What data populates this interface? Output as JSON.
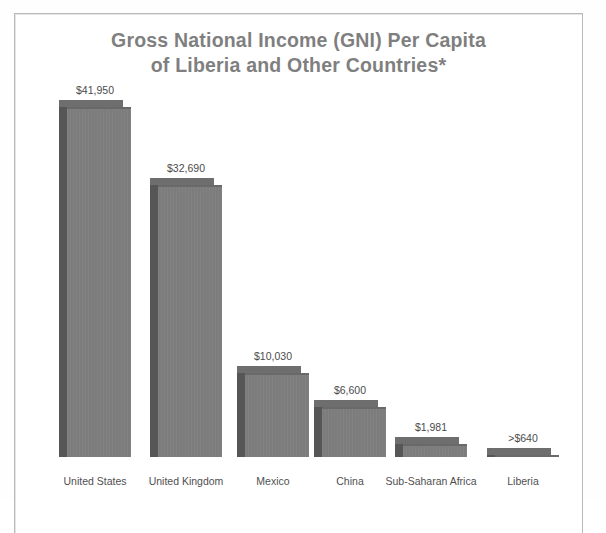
{
  "figure": {
    "title_line_1": "Gross National Income (GNI) Per Capita",
    "title_line_2": "of Liberia and Other Countries*",
    "title_color": "#7f7f7f",
    "background_color": "#ffffff",
    "frame_color": "#b9b9b9"
  },
  "chart_data": {
    "type": "bar",
    "title": "Gross National Income (GNI) Per Capita of Liberia and Other Countries*",
    "xlabel": "",
    "ylabel": "",
    "grid": false,
    "legend": false,
    "ylim": [
      0,
      41950
    ],
    "style": "3d-column",
    "bar_color": "#7c7c7c",
    "bar_side_color": "#565656",
    "bar_top_color": "#6e6e6e",
    "categories": [
      "United States",
      "United Kingdom",
      "Mexico",
      "China",
      "Sub-Saharan Africa",
      "Liberia"
    ],
    "values": [
      41950,
      32690,
      10030,
      6600,
      1981,
      640
    ],
    "value_labels": [
      "$41,950",
      "$32,690",
      "$10,030",
      "$6,600",
      "$1,981",
      ">$640"
    ],
    "bars": [
      {
        "category": "United States",
        "value": 41950,
        "label": "$41,950",
        "x": 59,
        "width": 72,
        "top": 100,
        "base": 457
      },
      {
        "category": "United Kingdom",
        "value": 32690,
        "label": "$32,690",
        "x": 150,
        "width": 72,
        "top": 178,
        "base": 457
      },
      {
        "category": "Mexico",
        "value": 10030,
        "label": "$10,030",
        "x": 237,
        "width": 72,
        "top": 366,
        "base": 457
      },
      {
        "category": "China",
        "value": 6600,
        "label": "$6,600",
        "x": 314,
        "width": 72,
        "top": 400,
        "base": 457
      },
      {
        "category": "Sub-Saharan Africa",
        "value": 1981,
        "label": "$1,981",
        "x": 395,
        "width": 72,
        "top": 437,
        "base": 457
      },
      {
        "category": "Liberia",
        "value": 640,
        "label": ">$640",
        "x": 487,
        "width": 72,
        "top": 448,
        "base": 457
      }
    ]
  }
}
